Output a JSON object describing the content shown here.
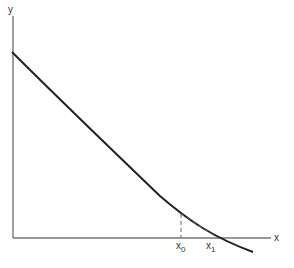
{
  "diagram": {
    "axes": {
      "x_label": "x",
      "y_label": "y"
    },
    "points": [
      {
        "id": "x0",
        "base": "x",
        "sub": "0"
      },
      {
        "id": "x1",
        "base": "x",
        "sub": "1"
      }
    ],
    "elements": {
      "curve": "decreasing convex function curve",
      "tangent": "dashed tangent line at x0 meeting x-axis at x1",
      "vertical": "dashed vertical line from x-axis to curve at x0"
    },
    "colors": {
      "axis": "#777777",
      "curve": "#222222",
      "dashed": "#666666",
      "text": "#333333"
    }
  }
}
